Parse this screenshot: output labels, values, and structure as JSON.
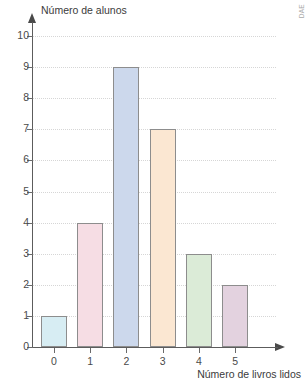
{
  "watermark": {
    "text": "DAE"
  },
  "chart_data": {
    "type": "bar",
    "title": "",
    "xlabel": "Número de livros lidos",
    "ylabel": "Número de alunos",
    "categories": [
      "0",
      "1",
      "2",
      "3",
      "4",
      "5"
    ],
    "values": [
      1,
      4,
      9,
      7,
      3,
      2
    ],
    "ylim": [
      0,
      10
    ],
    "ytick_labels": [
      "0",
      "1",
      "2",
      "3",
      "4",
      "5",
      "6",
      "7",
      "8",
      "9",
      "10"
    ],
    "ytick_values": [
      0,
      1,
      2,
      3,
      4,
      5,
      6,
      7,
      8,
      9,
      10
    ],
    "grid": true,
    "grid_orientation": "horizontal",
    "grid_style": "dotted",
    "legend": "none",
    "bar_colors": [
      "#d7edf3",
      "#f6dde4",
      "#ccd8ec",
      "#fbe7d2",
      "#dbebd7",
      "#e3d2df"
    ],
    "bar_border_color": "#8d8d8d",
    "axis_color": "#5c5c5c",
    "grid_color": "#d6d6d6",
    "text_color": "#3b3b3b"
  }
}
